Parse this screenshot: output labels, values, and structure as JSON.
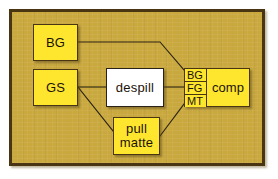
{
  "diagram": {
    "colors": {
      "node_fill": "#ffe62e",
      "node_fill_white": "#ffffff",
      "node_border": "#4a3512",
      "canvas_fill": "#c9a83e",
      "frame_border": "#4a3512",
      "wire": "#2b2310"
    }
  },
  "nodes": {
    "bg": {
      "label": "BG"
    },
    "gs": {
      "label": "GS"
    },
    "despill": {
      "label": "despill"
    },
    "pull_matte": {
      "label_line1": "pull",
      "label_line2": "matte"
    },
    "comp": {
      "label": "comp",
      "ports": [
        {
          "label": "BG"
        },
        {
          "label": "FG"
        },
        {
          "label": "MT"
        }
      ]
    }
  },
  "connections": [
    {
      "from": "bg",
      "to": "comp.port.BG"
    },
    {
      "from": "gs",
      "to": "despill"
    },
    {
      "from": "gs",
      "to": "pull_matte"
    },
    {
      "from": "despill",
      "to": "comp.port.FG"
    },
    {
      "from": "pull_matte",
      "to": "comp.port.MT"
    }
  ]
}
